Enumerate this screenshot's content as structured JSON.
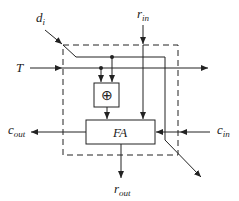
{
  "diagram": {
    "type": "cell-schematic",
    "inputs": {
      "d": {
        "base": "d",
        "sub": "i"
      },
      "t": {
        "base": "T",
        "sub": ""
      },
      "r_in": {
        "base": "r",
        "sub": "in"
      },
      "c_in": {
        "base": "c",
        "sub": "in"
      }
    },
    "outputs": {
      "c_out": {
        "base": "c",
        "sub": "out"
      },
      "r_out": {
        "base": "r",
        "sub": "out"
      }
    },
    "blocks": {
      "xor": {
        "symbol": "⊕"
      },
      "fa": {
        "label": "FA"
      }
    },
    "colors": {
      "stroke": "#222222",
      "background": "#ffffff"
    }
  }
}
